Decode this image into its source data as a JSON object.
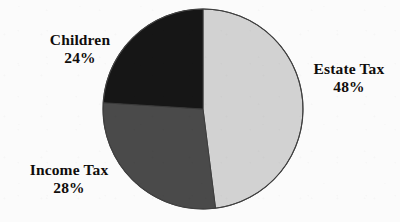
{
  "figure": {
    "background_color": "#fbfbfb",
    "outline_color": "#3b3b3b"
  },
  "chart_data": {
    "type": "pie",
    "title": "",
    "subtitle": "",
    "xlabel": "",
    "ylabel": "",
    "legend_position": "none",
    "grid": false,
    "labels_inline": true,
    "start_angle_deg": 0,
    "direction": "clockwise",
    "categories": [
      "Estate Tax",
      "Income Tax",
      "Children"
    ],
    "values": [
      48,
      28,
      24
    ],
    "value_suffix": "%",
    "slices": [
      {
        "name": "Estate Tax",
        "value": 48,
        "value_text": "48%",
        "color": "#d2d2d2",
        "start_deg": 0,
        "end_deg": 172.8,
        "label_position": "right"
      },
      {
        "name": "Income Tax",
        "value": 28,
        "value_text": "28%",
        "color": "#4a4a4a",
        "start_deg": 172.8,
        "end_deg": 273.6,
        "label_position": "bottom-left"
      },
      {
        "name": "Children",
        "value": 24,
        "value_text": "24%",
        "color": "#161616",
        "start_deg": 273.6,
        "end_deg": 360,
        "label_position": "top-left"
      }
    ]
  },
  "labels": {
    "children": {
      "name": "Children",
      "value_text": "24%"
    },
    "estate_tax": {
      "name": "Estate Tax",
      "value_text": "48%"
    },
    "income_tax": {
      "name": "Income Tax",
      "value_text": "28%"
    }
  }
}
